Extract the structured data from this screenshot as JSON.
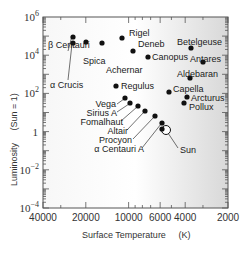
{
  "chart_data": {
    "type": "scatter",
    "title": "",
    "xlabel": "Surface Temperature (K)",
    "ylabel": "Luminosity (Sun = 1)",
    "xscale": "log",
    "yscale": "log",
    "x_reversed": true,
    "xlim": [
      40000,
      2000
    ],
    "ylim": [
      0.0001,
      1000000
    ],
    "grid": false,
    "legend": null,
    "x_ticks": [
      {
        "value": 40000,
        "label": "40000"
      },
      {
        "value": 20000,
        "label": "20000"
      },
      {
        "value": 10000,
        "label": "10000"
      },
      {
        "value": 6000,
        "label": "6000"
      },
      {
        "value": 4000,
        "label": "4000"
      },
      {
        "value": 2000,
        "label": "2000"
      }
    ],
    "y_ticks": [
      {
        "value": 1000000,
        "base": "10",
        "exp": "6"
      },
      {
        "value": 10000,
        "base": "10",
        "exp": "4"
      },
      {
        "value": 100,
        "base": "10",
        "exp": "2"
      },
      {
        "value": 1,
        "base": "1",
        "exp": ""
      },
      {
        "value": 0.01,
        "base": "10",
        "exp": "−2"
      },
      {
        "value": 0.0001,
        "base": "10",
        "exp": "−4"
      }
    ],
    "points": [
      {
        "name": "β Centauri",
        "temperature": 25000,
        "luminosity": 5000,
        "px": 73,
        "py": 37,
        "lx": 48,
        "ly": 48,
        "lanchor": "start",
        "leader": [
          68,
          51,
          72,
          36
        ]
      },
      {
        "name": "α Crucis",
        "temperature": 25000,
        "luminosity": 2500,
        "px": 73,
        "py": 43,
        "lx": 50,
        "ly": 88,
        "lanchor": "start",
        "leader": [
          68,
          80,
          72,
          44
        ]
      },
      {
        "name": "Spica",
        "temperature": 20000,
        "luminosity": 2000,
        "px": 86,
        "py": 42,
        "lx": 83,
        "ly": 64,
        "lanchor": "start",
        "leader": null
      },
      {
        "name": "Achernar",
        "temperature": 15000,
        "luminosity": 1500,
        "px": 102,
        "py": 43,
        "lx": 106,
        "ly": 73,
        "lanchor": "start",
        "leader": null
      },
      {
        "name": "Rigel",
        "temperature": 11000,
        "luminosity": 60000,
        "px": 122,
        "py": 38,
        "lx": 129,
        "ly": 36,
        "lanchor": "start",
        "leader": null
      },
      {
        "name": "Deneb",
        "temperature": 9500,
        "luminosity": 30000,
        "px": 133,
        "py": 51,
        "lx": 138,
        "ly": 47,
        "lanchor": "start",
        "leader": null
      },
      {
        "name": "Canopus",
        "temperature": 7500,
        "luminosity": 15000,
        "px": 148,
        "py": 57,
        "lx": 152,
        "ly": 60,
        "lanchor": "start",
        "leader": null
      },
      {
        "name": "Betelgeuse",
        "temperature": 3500,
        "luminosity": 20000,
        "px": 191,
        "py": 48,
        "lx": 177,
        "ly": 45,
        "lanchor": "start",
        "leader": null
      },
      {
        "name": "Antares",
        "temperature": 3200,
        "luminosity": 8000,
        "px": 203,
        "py": 62,
        "lx": 190,
        "ly": 62,
        "lanchor": "start",
        "leader": null
      },
      {
        "name": "Aldebaran",
        "temperature": 4000,
        "luminosity": 300,
        "px": 190,
        "py": 78,
        "lx": 177,
        "ly": 77,
        "lanchor": "start",
        "leader": null
      },
      {
        "name": "Regulus",
        "temperature": 12000,
        "luminosity": 150,
        "px": 116,
        "py": 86,
        "lx": 121,
        "ly": 89,
        "lanchor": "start",
        "leader": null
      },
      {
        "name": "Capella",
        "temperature": 5200,
        "luminosity": 100,
        "px": 169,
        "py": 92,
        "lx": 173,
        "ly": 92,
        "lanchor": "start",
        "leader": null
      },
      {
        "name": "Arcturus",
        "temperature": 4300,
        "luminosity": 70,
        "px": 187,
        "py": 97,
        "lx": 191,
        "ly": 101,
        "lanchor": "start",
        "leader": null
      },
      {
        "name": "Pollux",
        "temperature": 4500,
        "luminosity": 40,
        "px": 184,
        "py": 103,
        "lx": 189,
        "ly": 110,
        "lanchor": "start",
        "leader": null
      },
      {
        "name": "Vega",
        "temperature": 9600,
        "luminosity": 50,
        "px": 125,
        "py": 98,
        "lx": 116,
        "ly": 107,
        "lanchor": "end",
        "leader": [
          117,
          104,
          124,
          99
        ]
      },
      {
        "name": "Sirius A",
        "temperature": 9900,
        "luminosity": 25,
        "px": 130,
        "py": 103,
        "lx": 117,
        "ly": 116,
        "lanchor": "end",
        "leader": [
          117,
          112,
          129,
          104
        ]
      },
      {
        "name": "Fomalhaut",
        "temperature": 8600,
        "luminosity": 15,
        "px": 138,
        "py": 106,
        "lx": 123,
        "ly": 125,
        "lanchor": "end",
        "leader": [
          121,
          121,
          137,
          107
        ]
      },
      {
        "name": "Altair",
        "temperature": 7700,
        "luminosity": 10,
        "px": 145,
        "py": 111,
        "lx": 128,
        "ly": 134,
        "lanchor": "end",
        "leader": [
          127,
          130,
          144,
          112
        ]
      },
      {
        "name": "Procyon",
        "temperature": 6500,
        "luminosity": 7,
        "px": 155,
        "py": 116,
        "lx": 132,
        "ly": 143,
        "lanchor": "end",
        "leader": [
          133,
          139,
          154,
          117
        ]
      },
      {
        "name": "α Centauri A",
        "temperature": 5800,
        "luminosity": 1.5,
        "px": 162,
        "py": 123,
        "lx": 144,
        "ly": 152,
        "lanchor": "end",
        "leader": [
          142,
          148,
          161,
          124
        ]
      },
      {
        "name": "Sun",
        "temperature": 5800,
        "luminosity": 1,
        "px": 166,
        "py": 130,
        "lx": 180,
        "ly": 153,
        "lanchor": "start",
        "leader": [
          178,
          148,
          168,
          133
        ],
        "open": true
      }
    ]
  },
  "axes": {
    "xlabel_main": "Surface Temperature",
    "xlabel_unit": "(K)",
    "ylabel_main": "Luminosity",
    "ylabel_unit": "(Sun = 1)"
  }
}
